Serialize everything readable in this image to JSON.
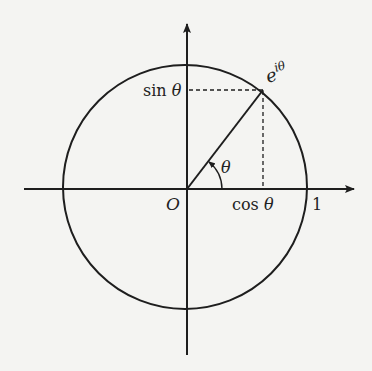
{
  "diagram": {
    "type": "unit-circle",
    "colors": {
      "background": "#f4f4f2",
      "stroke": "#1e1e1e",
      "text": "#222222"
    },
    "geometry": {
      "origin": [
        187,
        189
      ],
      "circle_center": [
        185,
        187
      ],
      "radius": 122,
      "point": [
        263,
        90
      ],
      "angle_deg": 52,
      "x_axis": {
        "from": [
          24,
          189
        ],
        "to": [
          355,
          189
        ]
      },
      "y_axis": {
        "from": [
          187,
          355
        ],
        "to": [
          187,
          23
        ]
      }
    },
    "labels": {
      "origin": "O",
      "point": "e",
      "point_exponent": "iθ",
      "sin_prefix": "sin ",
      "sin_var": "θ",
      "cos_prefix": "cos ",
      "cos_var": "θ",
      "angle": "θ",
      "unit": "1"
    }
  }
}
